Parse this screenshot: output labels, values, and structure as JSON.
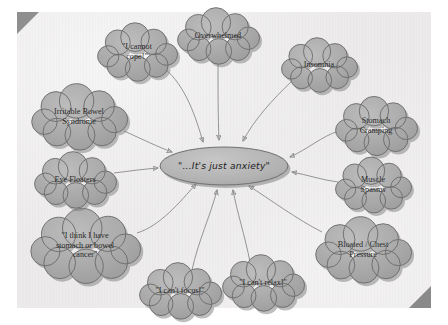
{
  "page": {
    "type": "scanned-diagram",
    "background_color": "#eceaea",
    "margin_color": "#ffffff",
    "curl_color": "#8f8f8f"
  },
  "diagram": {
    "center": {
      "label": "\"...It's just anxiety\"",
      "shape": "ellipse",
      "fill_color": "#b4b4b4",
      "stroke_color": "#6f6f6f",
      "cx": 224,
      "cy": 166,
      "rx": 64,
      "ry": 19
    },
    "cloud_style": {
      "fill_color": "#a8a8a8",
      "stroke_color": "#6a6a6a",
      "shadow_color": "#7d7d7d",
      "text_color": "#2b2b2b"
    },
    "arrow_style": {
      "stroke_color": "#8a8a8a",
      "stroke_width": 0.9
    },
    "clouds": [
      {
        "id": "cloud-i-cannot-cope",
        "lines": [
          "\"I cannot",
          "cope!\""
        ],
        "cx": 137,
        "cy": 52,
        "rx": 40,
        "ry": 24,
        "arrow": {
          "x1": 164,
          "y1": 68,
          "x2": 203,
          "y2": 142,
          "cx1": 186,
          "cy1": 86,
          "cx2": 196,
          "cy2": 118
        }
      },
      {
        "id": "cloud-overwhelmed",
        "lines": [
          "Overwhelmed"
        ],
        "cx": 218,
        "cy": 36,
        "rx": 41,
        "ry": 22,
        "arrow": {
          "x1": 218,
          "y1": 58,
          "x2": 219,
          "y2": 140,
          "cx1": 218,
          "cy1": 90,
          "cx2": 218,
          "cy2": 118
        }
      },
      {
        "id": "cloud-insomnia",
        "lines": [
          "Insomnia"
        ],
        "cx": 319,
        "cy": 65,
        "rx": 38,
        "ry": 22,
        "arrow": {
          "x1": 292,
          "y1": 81,
          "x2": 243,
          "y2": 141,
          "cx1": 272,
          "cy1": 100,
          "cx2": 254,
          "cy2": 120
        }
      },
      {
        "id": "cloud-stomach-cramping",
        "lines": [
          "Stomach",
          "Cramping"
        ],
        "cx": 376,
        "cy": 126,
        "rx": 41,
        "ry": 24,
        "arrow": {
          "x1": 339,
          "y1": 131,
          "x2": 290,
          "y2": 157,
          "cx1": 322,
          "cy1": 136,
          "cx2": 308,
          "cy2": 149
        }
      },
      {
        "id": "cloud-muscle-spasms",
        "lines": [
          "Muscle",
          "Spasms"
        ],
        "cx": 373,
        "cy": 185,
        "rx": 38,
        "ry": 23,
        "arrow": {
          "x1": 338,
          "y1": 182,
          "x2": 292,
          "y2": 172,
          "cx1": 322,
          "cy1": 180,
          "cx2": 308,
          "cy2": 175
        }
      },
      {
        "id": "cloud-bloated-chest-pressure",
        "lines": [
          "Bloated / Chest",
          "Pressure"
        ],
        "cx": 363,
        "cy": 250,
        "rx": 48,
        "ry": 26,
        "arrow": {
          "x1": 322,
          "y1": 232,
          "x2": 249,
          "y2": 186,
          "cx1": 298,
          "cy1": 220,
          "cx2": 268,
          "cy2": 198
        }
      },
      {
        "id": "cloud-i-cant-relax",
        "lines": [
          "\"I can't relax!\""
        ],
        "cx": 263,
        "cy": 283,
        "rx": 41,
        "ry": 22,
        "arrow": {
          "x1": 250,
          "y1": 262,
          "x2": 233,
          "y2": 190,
          "cx1": 245,
          "cy1": 236,
          "cx2": 237,
          "cy2": 212
        }
      },
      {
        "id": "cloud-i-cant-focus",
        "lines": [
          "\"I can't focus!\""
        ],
        "cx": 180,
        "cy": 291,
        "rx": 41,
        "ry": 22,
        "arrow": {
          "x1": 192,
          "y1": 270,
          "x2": 217,
          "y2": 190,
          "cx1": 198,
          "cy1": 242,
          "cx2": 211,
          "cy2": 214
        }
      },
      {
        "id": "cloud-stomach-or-bowel-cancer",
        "lines": [
          "\"I think I have",
          "stomach or bowel",
          "cancer\""
        ],
        "cx": 85,
        "cy": 246,
        "rx": 55,
        "ry": 29,
        "arrow": {
          "x1": 137,
          "y1": 233,
          "x2": 196,
          "y2": 184,
          "cx1": 160,
          "cy1": 226,
          "cx2": 180,
          "cy2": 202
        }
      },
      {
        "id": "cloud-eye-floaters",
        "lines": [
          "Eye Floaters"
        ],
        "cx": 75,
        "cy": 180,
        "rx": 41,
        "ry": 22,
        "arrow": {
          "x1": 114,
          "y1": 173,
          "x2": 158,
          "y2": 168,
          "cx1": 130,
          "cy1": 171,
          "cx2": 144,
          "cy2": 169
        }
      },
      {
        "id": "cloud-irritable-bowel-syndrome",
        "lines": [
          "Irritable Bowel",
          "Syndrome"
        ],
        "cx": 79,
        "cy": 117,
        "rx": 48,
        "ry": 26,
        "arrow": {
          "x1": 124,
          "y1": 131,
          "x2": 172,
          "y2": 152,
          "cx1": 142,
          "cy1": 139,
          "cx2": 158,
          "cy2": 147
        }
      }
    ]
  }
}
